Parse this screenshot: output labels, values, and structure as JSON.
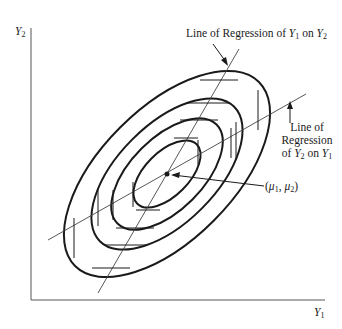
{
  "diagram": {
    "type": "bivariate normal contour diagram",
    "axes": {
      "x_label_var": "Y",
      "x_label_sub": "1",
      "y_label_var": "Y",
      "y_label_sub": "2"
    },
    "contours": {
      "count": 4,
      "description": "concentric tilted ellipses (equal-density contours)"
    },
    "center": {
      "label_open": "(",
      "mu1_var": "μ",
      "mu1_sub": "1",
      "sep": ", ",
      "mu2_var": "μ",
      "mu2_sub": "2",
      "label_close": ")"
    },
    "regression_y1_on_y2": {
      "text_prefix": "Line of Regression of ",
      "var1": "Y",
      "sub1": "1",
      "mid": " on ",
      "var2": "Y",
      "sub2": "2"
    },
    "regression_y2_on_y1": {
      "line1": "Line of",
      "line2": "Regression",
      "line3_prefix": "of ",
      "var1": "Y",
      "sub1": "2",
      "mid": " on ",
      "var2": "Y",
      "sub2": "1"
    },
    "colors": {
      "ink": "#1a1a1a",
      "thin_line": "#444444",
      "background": "#ffffff"
    }
  }
}
